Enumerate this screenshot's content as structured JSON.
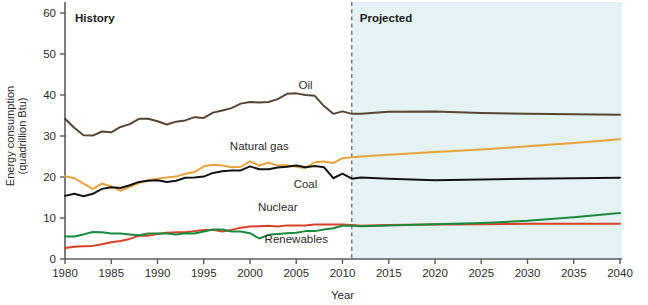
{
  "chart_data": {
    "type": "line",
    "title": "",
    "xlabel": "Year",
    "ylabel": "Energy consumption (quadrillion Btu)",
    "ylabel_line1": "Energy consumption",
    "ylabel_line2": "(quadrillion Btu)",
    "xlim": [
      1980,
      2040
    ],
    "ylim": [
      0,
      60
    ],
    "yticks": [
      0,
      10,
      20,
      30,
      40,
      50,
      60
    ],
    "xticks": [
      1980,
      1985,
      1990,
      1995,
      2000,
      2005,
      2010,
      2015,
      2020,
      2025,
      2030,
      2035,
      2040
    ],
    "grid": false,
    "legend_position": "inline-labels",
    "history_label": "History",
    "projected_label": "Projected",
    "projection_start_year": 2011,
    "projected_band_color": "#e4f2f3",
    "x": [
      1980,
      1981,
      1982,
      1983,
      1984,
      1985,
      1986,
      1987,
      1988,
      1989,
      1990,
      1991,
      1992,
      1993,
      1994,
      1995,
      1996,
      1997,
      1998,
      1999,
      2000,
      2001,
      2002,
      2003,
      2004,
      2005,
      2006,
      2007,
      2008,
      2009,
      2010,
      2011,
      2012,
      2015,
      2020,
      2025,
      2030,
      2035,
      2040
    ],
    "series": [
      {
        "name": "Oil",
        "color": "#5a4433",
        "label_x": 2006,
        "label_y": 41.5,
        "values": [
          34.2,
          32.0,
          30.2,
          30.1,
          31.1,
          30.9,
          32.2,
          32.9,
          34.2,
          34.2,
          33.6,
          32.8,
          33.5,
          33.8,
          34.6,
          34.4,
          35.7,
          36.2,
          36.8,
          37.9,
          38.3,
          38.2,
          38.3,
          39.0,
          40.3,
          40.4,
          40.0,
          39.8,
          37.3,
          35.4,
          36.0,
          35.4,
          35.4,
          35.9,
          36.0,
          35.6,
          35.4,
          35.3,
          35.2
        ]
      },
      {
        "name": "Natural gas",
        "color": "#e8a33d",
        "label_x": 2001,
        "label_y": 26.5,
        "values": [
          20.2,
          19.7,
          18.4,
          17.1,
          18.4,
          17.7,
          16.6,
          17.6,
          18.5,
          19.3,
          19.6,
          19.9,
          20.1,
          20.8,
          21.2,
          22.6,
          23.0,
          22.8,
          22.4,
          22.5,
          23.8,
          22.8,
          23.5,
          22.8,
          22.9,
          22.5,
          22.2,
          23.6,
          23.8,
          23.4,
          24.6,
          24.8,
          25.0,
          25.4,
          26.1,
          26.7,
          27.5,
          28.3,
          29.2
        ]
      },
      {
        "name": "Coal",
        "color": "#141414",
        "label_x": 2006,
        "label_y": 17.3,
        "values": [
          15.4,
          15.9,
          15.3,
          15.9,
          17.1,
          17.5,
          17.3,
          18.0,
          18.8,
          19.1,
          19.2,
          18.8,
          19.1,
          19.8,
          19.9,
          20.1,
          21.0,
          21.4,
          21.6,
          21.6,
          22.6,
          21.9,
          21.9,
          22.3,
          22.5,
          22.8,
          22.4,
          22.7,
          22.4,
          19.7,
          20.8,
          19.6,
          19.9,
          19.6,
          19.2,
          19.4,
          19.6,
          19.7,
          19.8
        ]
      },
      {
        "name": "Nuclear",
        "color": "#d8402a",
        "label_x": 2003,
        "label_y": 11.6,
        "values": [
          2.7,
          3.0,
          3.1,
          3.2,
          3.6,
          4.1,
          4.4,
          4.9,
          5.7,
          5.7,
          6.1,
          6.4,
          6.5,
          6.5,
          6.8,
          7.1,
          7.1,
          6.7,
          7.1,
          7.6,
          7.9,
          8.0,
          8.1,
          7.9,
          8.2,
          8.2,
          8.2,
          8.4,
          8.4,
          8.4,
          8.4,
          8.3,
          8.1,
          8.3,
          8.4,
          8.5,
          8.6,
          8.6,
          8.6
        ]
      },
      {
        "name": "Renewables",
        "color": "#1a8a3d",
        "label_x": 2005,
        "label_y": 3.9,
        "values": [
          5.5,
          5.5,
          6.0,
          6.6,
          6.5,
          6.2,
          6.2,
          6.0,
          5.8,
          6.2,
          6.2,
          6.2,
          6.0,
          6.3,
          6.2,
          6.7,
          7.2,
          7.2,
          6.7,
          6.7,
          6.3,
          5.0,
          5.9,
          6.1,
          6.3,
          6.4,
          6.8,
          6.8,
          7.2,
          7.5,
          8.1,
          8.1,
          8.0,
          8.2,
          8.5,
          8.8,
          9.3,
          10.2,
          11.2
        ]
      }
    ]
  }
}
